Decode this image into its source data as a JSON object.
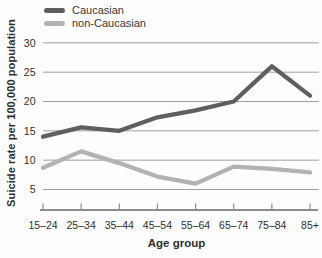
{
  "chart_data": {
    "type": "line",
    "title": "",
    "xlabel": "Age group",
    "ylabel": "Suicide rate per 100,000 population",
    "categories": [
      "15–24",
      "25–34",
      "35–44",
      "45–54",
      "55–64",
      "65–74",
      "75–84",
      "85+"
    ],
    "series": [
      {
        "name": "Caucasian",
        "color": "#5f5f5f",
        "values": [
          14,
          15.6,
          15,
          17.3,
          18.5,
          20,
          26,
          21
        ]
      },
      {
        "name": "non-Caucasian",
        "color": "#b2b2b2",
        "values": [
          8.7,
          11.5,
          9.5,
          7.2,
          6,
          8.9,
          8.5,
          7.9
        ]
      }
    ],
    "y_ticks": [
      5,
      10,
      15,
      20,
      25,
      30
    ],
    "ylim": [
      1.5,
      31
    ],
    "grid": true,
    "legend_position": "top-left"
  },
  "colors": {
    "grid": "#9e9e9e",
    "axis": "#8c8c8c",
    "text": "#2e2e2e",
    "background": "#fdfdfd"
  }
}
